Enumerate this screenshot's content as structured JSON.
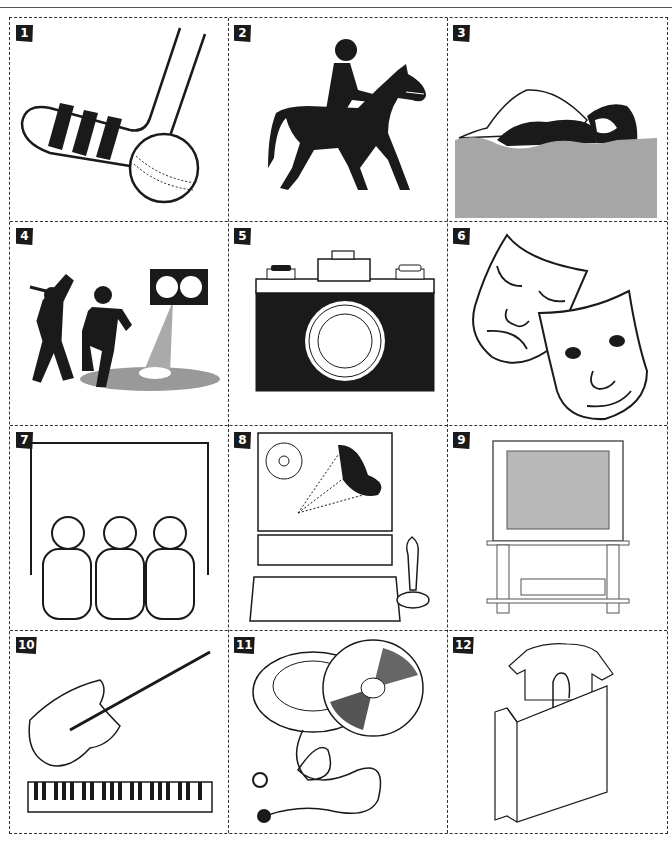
{
  "page": {
    "layout": "3x4 picture grid worksheet",
    "colors": {
      "ink": "#1a1a1a",
      "border": "#333333",
      "gray_fill": "#a6a6a6",
      "light_gray": "#d0d0d0"
    }
  },
  "cells": [
    {
      "number": "1",
      "picture": "hockey-stick-and-ball"
    },
    {
      "number": "2",
      "picture": "horse-rider"
    },
    {
      "number": "3",
      "picture": "swimmer"
    },
    {
      "number": "4",
      "picture": "dancers-spotlight"
    },
    {
      "number": "5",
      "picture": "camera"
    },
    {
      "number": "6",
      "picture": "theatre-masks"
    },
    {
      "number": "7",
      "picture": "cinema-audience"
    },
    {
      "number": "8",
      "picture": "computer-game-joystick"
    },
    {
      "number": "9",
      "picture": "television-video"
    },
    {
      "number": "10",
      "picture": "guitar-keyboard"
    },
    {
      "number": "11",
      "picture": "cd-player-earphones"
    },
    {
      "number": "12",
      "picture": "shopping-bag-tshirt"
    }
  ]
}
